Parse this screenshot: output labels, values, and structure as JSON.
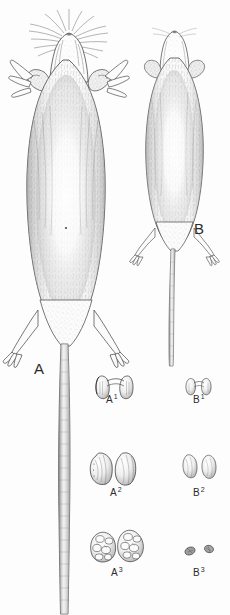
{
  "plate": {
    "title": "Comparative dorsal views and dentition of two rodent specimens",
    "background_color": "#fdfdfd",
    "ink_color": "#3a3a3a",
    "medium": "stippled pen-and-ink scientific illustration",
    "width": 230,
    "height": 615
  },
  "specimens": [
    {
      "id": "A",
      "label": "A",
      "description": "Large rodent, dorsal view, head toward top, long naked tail extending to bottom edge",
      "relative_size": "large",
      "label_position": {
        "x": 40,
        "y": 368
      }
    },
    {
      "id": "B",
      "label": "B",
      "description": "Smaller rodent, dorsal view, head toward top, long tail",
      "relative_size": "small",
      "label_position": {
        "x": 199,
        "y": 228
      }
    }
  ],
  "dentition": {
    "rows": [
      {
        "row_id": "incisors",
        "row_index": 1,
        "items": [
          {
            "label_base": "A",
            "label_sup": "1",
            "specimen": "A",
            "count": 2,
            "shape": "paired incisors joined by narrow bridge",
            "label_position": {
              "x": 110,
              "y": 400
            }
          },
          {
            "label_base": "B",
            "label_sup": "1",
            "specimen": "B",
            "count": 2,
            "shape": "paired incisors joined by narrow bridge, smaller",
            "label_position": {
              "x": 197,
              "y": 400
            }
          }
        ]
      },
      {
        "row_id": "premolars",
        "row_index": 2,
        "items": [
          {
            "label_base": "A",
            "label_sup": "2",
            "specimen": "A",
            "count": 2,
            "shape": "two oval crowns, occlusal view",
            "label_position": {
              "x": 114,
              "y": 492
            }
          },
          {
            "label_base": "B",
            "label_sup": "2",
            "specimen": "B",
            "count": 2,
            "shape": "two small oval crowns, occlusal view",
            "label_position": {
              "x": 197,
              "y": 492
            }
          }
        ]
      },
      {
        "row_id": "molars",
        "row_index": 3,
        "items": [
          {
            "label_base": "A",
            "label_sup": "3",
            "specimen": "A",
            "count": 2,
            "shape": "two cusped molar crowns, occlusal view",
            "label_position": {
              "x": 115,
              "y": 572
            }
          },
          {
            "label_base": "B",
            "label_sup": "3",
            "specimen": "B",
            "count": 2,
            "shape": "two minute molar crowns, occlusal view",
            "label_position": {
              "x": 197,
              "y": 572
            }
          }
        ]
      }
    ]
  }
}
